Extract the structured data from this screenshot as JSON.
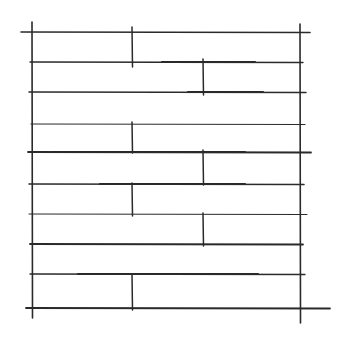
{
  "diagram": {
    "width": 349,
    "height": 343,
    "background": "#ffffff",
    "stroke_color": "#2a2a2a",
    "frame": {
      "left": {
        "x": 32,
        "y1": 22,
        "y2": 318
      },
      "right": {
        "x": 300,
        "y1": 24,
        "y2": 323
      }
    },
    "horizontal_lines": [
      {
        "y": 32,
        "x1": 21,
        "x2": 310,
        "w": 1.6
      },
      {
        "y": 62,
        "x1": 30,
        "x2": 303,
        "w": 1.3
      },
      {
        "y": 92,
        "x1": 29,
        "x2": 306,
        "w": 1.5
      },
      {
        "y": 124,
        "x1": 31,
        "x2": 305,
        "w": 1.2
      },
      {
        "y": 152,
        "x1": 28,
        "x2": 311,
        "w": 1.8
      },
      {
        "y": 184,
        "x1": 29,
        "x2": 304,
        "w": 1.6
      },
      {
        "y": 214,
        "x1": 29,
        "x2": 307,
        "w": 1.2
      },
      {
        "y": 244,
        "x1": 30,
        "x2": 303,
        "w": 1.8
      },
      {
        "y": 274,
        "x1": 30,
        "x2": 305,
        "w": 1.3
      },
      {
        "y": 308,
        "x1": 26,
        "x2": 330,
        "w": 1.8
      }
    ],
    "vertical_joints": [
      {
        "x": 132,
        "y1": 27,
        "y2": 67
      },
      {
        "x": 203,
        "y1": 59,
        "y2": 95
      },
      {
        "x": 132,
        "y1": 122,
        "y2": 153
      },
      {
        "x": 203,
        "y1": 150,
        "y2": 185
      },
      {
        "x": 132,
        "y1": 183,
        "y2": 216
      },
      {
        "x": 203,
        "y1": 213,
        "y2": 246
      },
      {
        "x": 132,
        "y1": 275,
        "y2": 310
      }
    ],
    "heavy_segments": [
      {
        "y": 62,
        "x1": 162,
        "x2": 255
      },
      {
        "y": 92,
        "x1": 188,
        "x2": 263
      },
      {
        "y": 152,
        "x1": 52,
        "x2": 245
      },
      {
        "y": 184,
        "x1": 100,
        "x2": 245
      },
      {
        "y": 274,
        "x1": 78,
        "x2": 258
      }
    ]
  }
}
